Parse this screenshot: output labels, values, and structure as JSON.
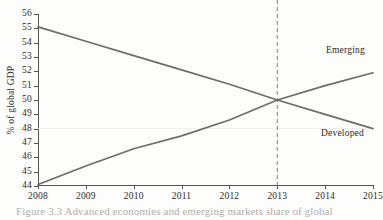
{
  "figure": {
    "caption": "Figure 3.3  Advanced economies and emerging markets share of global",
    "background_color": "#fdfdfc",
    "axis_color": "#55554f",
    "line_color": "#6d6d66",
    "gridline_color": "#efeeea"
  },
  "chart_data": {
    "type": "line",
    "title": "",
    "xlabel": "",
    "ylabel": "% of global GDP",
    "xlim": [
      2008,
      2015
    ],
    "ylim": [
      44,
      56
    ],
    "grid": true,
    "gridlines_y": [
      48
    ],
    "legend_position": "inline-right",
    "x": [
      2008,
      2009,
      2010,
      2011,
      2012,
      2013,
      2014,
      2015
    ],
    "x_ticks": [
      "2008",
      "2009",
      "2010",
      "2011",
      "2012",
      "2013",
      "2014",
      "2015"
    ],
    "y_ticks": [
      "44",
      "45",
      "46",
      "47",
      "48",
      "49",
      "50",
      "51",
      "52",
      "53",
      "54",
      "55",
      "56"
    ],
    "y_tick_values": [
      44,
      45,
      46,
      47,
      48,
      49,
      50,
      51,
      52,
      53,
      54,
      55,
      56
    ],
    "series": [
      {
        "name": "Developed",
        "values": [
          55.1,
          54.1,
          53.1,
          52.1,
          51.1,
          50.0,
          49.0,
          48.0
        ]
      },
      {
        "name": "Emerging",
        "values": [
          44.1,
          45.4,
          46.6,
          47.5,
          48.6,
          50.0,
          51.0,
          51.9
        ]
      }
    ],
    "annotations": [
      {
        "name": "crossover-marker",
        "type": "vertical-dashed-line",
        "x": 2013,
        "label": "2013",
        "y_value": 50.0
      }
    ],
    "series_labels": {
      "emerging": "Emerging",
      "developed": "Developed"
    }
  }
}
